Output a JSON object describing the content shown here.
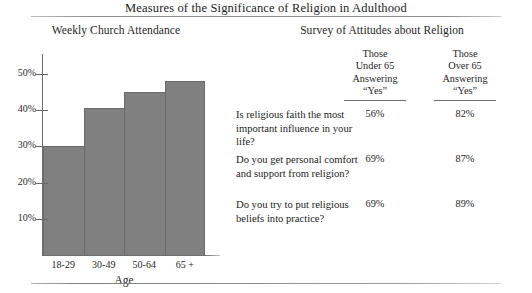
{
  "figure": {
    "title": "Measures of the Significance of Religion in Adulthood"
  },
  "chart_data": {
    "type": "bar",
    "title": "Weekly Church Attendance",
    "xlabel": "Age",
    "ylabel": "",
    "categories": [
      "18-29",
      "30-49",
      "50-64",
      "65 +"
    ],
    "values": [
      30,
      40.5,
      45,
      48
    ],
    "ylim": [
      0,
      55
    ],
    "yticks": [
      10,
      20,
      30,
      40,
      50
    ],
    "ytick_labels": [
      "10%",
      "20%",
      "30%",
      "40%",
      "50%"
    ],
    "grid": false,
    "legend": null,
    "bar_color": "#808080"
  },
  "table": {
    "title": "Survey of Attitudes about Religion",
    "columns": [
      {
        "line1": "Those",
        "line2": "Under 65",
        "line3": "Answering",
        "line4": "“Yes”"
      },
      {
        "line1": "Those",
        "line2": "Over 65",
        "line3": "Answering",
        "line4": "“Yes”"
      }
    ],
    "rows": [
      {
        "question": "Is religious faith the most important influence in your life?",
        "under65": "56%",
        "over65": "82%"
      },
      {
        "question": "Do you get personal comfort and support from religion?",
        "under65": "69%",
        "over65": "87%"
      },
      {
        "question": "Do you try to put religious beliefs into practice?",
        "under65": "69%",
        "over65": "89%"
      }
    ]
  }
}
